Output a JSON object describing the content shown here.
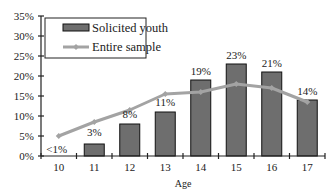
{
  "chart_data": {
    "type": "bar",
    "title": "",
    "xlabel": "Age",
    "ylabel": "",
    "ylim": [
      0,
      35
    ],
    "yticks": [
      "0%",
      "5%",
      "10%",
      "15%",
      "20%",
      "25%",
      "30%",
      "35%"
    ],
    "categories": [
      "10",
      "11",
      "12",
      "13",
      "14",
      "15",
      "16",
      "17"
    ],
    "series": [
      {
        "name": "Solicited youth",
        "kind": "bar",
        "values": [
          0.5,
          3,
          8,
          11,
          19,
          23,
          21,
          14
        ],
        "labels": [
          "<1%",
          "3%",
          "8%",
          "11%",
          "19%",
          "23%",
          "21%",
          "14%"
        ]
      },
      {
        "name": "Entire sample",
        "kind": "line",
        "values": [
          5,
          8.5,
          11.5,
          15.5,
          16,
          18,
          17,
          13.5
        ]
      }
    ],
    "legend_position": "top-left inside",
    "grid": false
  },
  "colors": {
    "bar_fill": "#6e6e6e",
    "bar_stroke": "#111111",
    "line": "#a3a3a3",
    "axis": "#222222"
  }
}
